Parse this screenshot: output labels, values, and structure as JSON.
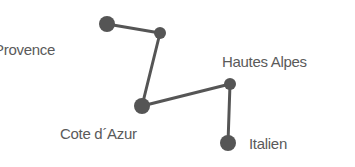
{
  "diagram": {
    "colors": {
      "node": "#555555",
      "edge": "#555555",
      "text": "#5a5a5a",
      "background": "#ffffff"
    },
    "nodes": [
      {
        "id": "n1",
        "x": 107,
        "y": 24,
        "r": 8
      },
      {
        "id": "n2",
        "x": 160,
        "y": 33,
        "r": 6
      },
      {
        "id": "n3",
        "x": 142,
        "y": 106,
        "r": 8
      },
      {
        "id": "n4",
        "x": 230,
        "y": 84,
        "r": 6
      },
      {
        "id": "n5",
        "x": 228,
        "y": 143,
        "r": 8
      }
    ],
    "edges": [
      [
        "n1",
        "n2"
      ],
      [
        "n2",
        "n3"
      ],
      [
        "n3",
        "n4"
      ],
      [
        "n4",
        "n5"
      ]
    ],
    "labels": {
      "provence": "Provence",
      "hautes_alpes": "Hautes Alpes",
      "cote_dazur": "Cote d´Azur",
      "italien": "Italien"
    }
  }
}
